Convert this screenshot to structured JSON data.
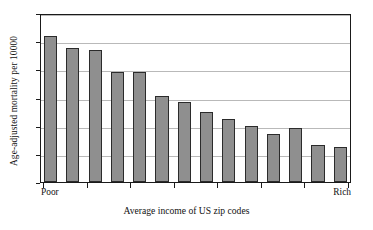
{
  "chart_data": {
    "type": "bar",
    "title": "",
    "xlabel": "Average income of US zip codes",
    "ylabel": "Age-adjusted mortality per 10000",
    "ylim": [
      40,
      100
    ],
    "yticks": [
      40,
      50,
      60,
      70,
      80,
      90,
      100
    ],
    "ytick_labels": [
      "40",
      "50",
      "60",
      "70",
      "80",
      "90",
      "100"
    ],
    "grid": true,
    "legend": "none",
    "x_axis_end_labels": {
      "left": "Poor",
      "right": "Rich"
    },
    "categories": [
      "1",
      "2",
      "3",
      "4",
      "5",
      "6",
      "7",
      "8",
      "9",
      "10",
      "11",
      "12",
      "13",
      "14"
    ],
    "values": [
      92,
      87.5,
      87,
      79,
      79,
      70.5,
      68.5,
      65,
      62.5,
      60,
      57,
      59,
      53,
      52.5
    ],
    "bar_color": "#8f8f8f",
    "bar_edge_color": "#2b2b2b",
    "grid_color": "#b9b9b9",
    "axis_color": "#1a1a1a",
    "background_color": "#ffffff"
  }
}
